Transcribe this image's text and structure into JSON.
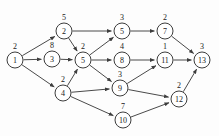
{
  "diagram": {
    "type": "directed-acyclic-graph",
    "node_radius": 8,
    "colors": {
      "background": "#fdfdfd",
      "node_fill": "#ffffff",
      "node_stroke": "#3d3d3d",
      "edge_stroke": "#4a4a4a",
      "text": "#1a1a1a"
    },
    "nodes": [
      {
        "id": "n1",
        "label": "1",
        "weight": "2",
        "x": 15,
        "y": 60,
        "wx": 15,
        "wy": 45
      },
      {
        "id": "n2",
        "label": "2",
        "weight": "5",
        "x": 64,
        "y": 31,
        "wx": 64,
        "wy": 16
      },
      {
        "id": "n3",
        "label": "3",
        "weight": "8",
        "x": 52,
        "y": 59,
        "wx": 52,
        "wy": 44
      },
      {
        "id": "n4",
        "label": "4",
        "weight": "2",
        "x": 63,
        "y": 93,
        "wx": 63,
        "wy": 78
      },
      {
        "id": "n5a",
        "label": "5",
        "weight": "2",
        "x": 83,
        "y": 60,
        "wx": 83,
        "wy": 45
      },
      {
        "id": "n5b",
        "label": "5",
        "weight": "3",
        "x": 122,
        "y": 31,
        "wx": 122,
        "wy": 16
      },
      {
        "id": "n7",
        "label": "7",
        "weight": "2",
        "x": 165,
        "y": 31,
        "wx": 165,
        "wy": 16
      },
      {
        "id": "n8",
        "label": "8",
        "weight": "4",
        "x": 122,
        "y": 60,
        "wx": 122,
        "wy": 45
      },
      {
        "id": "n9",
        "label": "9",
        "weight": "3",
        "x": 120,
        "y": 88,
        "wx": 120,
        "wy": 73
      },
      {
        "id": "n10",
        "label": "10",
        "weight": "7",
        "x": 123,
        "y": 120,
        "wx": 123,
        "wy": 105
      },
      {
        "id": "n11",
        "label": "11",
        "weight": "1",
        "x": 165,
        "y": 60,
        "wx": 165,
        "wy": 45
      },
      {
        "id": "n12",
        "label": "12",
        "weight": "2",
        "x": 179,
        "y": 99,
        "wx": 179,
        "wy": 84
      },
      {
        "id": "n13",
        "label": "13",
        "weight": "3",
        "x": 202,
        "y": 60,
        "wx": 202,
        "wy": 45
      }
    ],
    "edges": [
      {
        "from": "n1",
        "to": "n2"
      },
      {
        "from": "n1",
        "to": "n3"
      },
      {
        "from": "n1",
        "to": "n4"
      },
      {
        "from": "n2",
        "to": "n5b"
      },
      {
        "from": "n2",
        "to": "n5a"
      },
      {
        "from": "n3",
        "to": "n5a"
      },
      {
        "from": "n4",
        "to": "n5a"
      },
      {
        "from": "n4",
        "to": "n9"
      },
      {
        "from": "n4",
        "to": "n10"
      },
      {
        "from": "n5a",
        "to": "n5b"
      },
      {
        "from": "n5a",
        "to": "n8"
      },
      {
        "from": "n5a",
        "to": "n9"
      },
      {
        "from": "n5b",
        "to": "n7"
      },
      {
        "from": "n8",
        "to": "n11"
      },
      {
        "from": "n9",
        "to": "n11"
      },
      {
        "from": "n9",
        "to": "n12"
      },
      {
        "from": "n10",
        "to": "n12"
      },
      {
        "from": "n7",
        "to": "n13"
      },
      {
        "from": "n11",
        "to": "n13"
      },
      {
        "from": "n12",
        "to": "n13"
      }
    ]
  }
}
